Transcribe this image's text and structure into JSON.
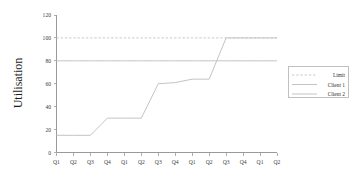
{
  "chart_data": {
    "type": "line",
    "title": "",
    "xlabel": "",
    "ylabel": "Utilisation",
    "ylim": [
      0,
      120
    ],
    "ytick_values": [
      0,
      20,
      40,
      60,
      80,
      100,
      120
    ],
    "ytick_labels": [
      "0",
      "20",
      "40",
      "60",
      "80",
      "100",
      "120"
    ],
    "grid": false,
    "legend_position": "right",
    "categories": [
      "Q1",
      "Q2",
      "Q3",
      "Q4",
      "Q1",
      "Q2",
      "Q3",
      "Q4",
      "Q1",
      "Q2",
      "Q3",
      "Q4",
      "Q1",
      "Q2"
    ],
    "series": [
      {
        "name": "Limit",
        "style": "dashed",
        "color": "#c9c9c9",
        "values": [
          100,
          100,
          100,
          100,
          100,
          100,
          100,
          100,
          100,
          100,
          100,
          100,
          100,
          100
        ]
      },
      {
        "name": "Client 1",
        "style": "solid",
        "color": "#c4c4c4",
        "values": [
          15,
          15,
          15,
          30,
          30,
          30,
          60,
          61,
          64,
          64,
          100,
          100,
          100,
          100
        ]
      },
      {
        "name": "Client 2",
        "style": "solid",
        "color": "#c4c4c4",
        "values": [
          80,
          80,
          80,
          80,
          80,
          80,
          80,
          80,
          80,
          80,
          80,
          80,
          80,
          80
        ]
      }
    ]
  },
  "legend": {
    "entries": [
      {
        "label": "Limit"
      },
      {
        "label": "Client 1"
      },
      {
        "label": "Client 2"
      }
    ]
  },
  "axes": {
    "y_title": "Utilisation"
  }
}
